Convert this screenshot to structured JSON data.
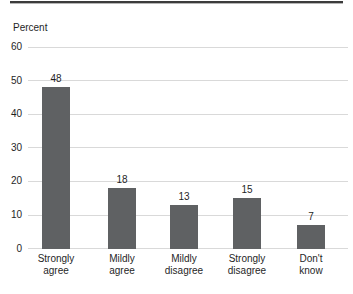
{
  "chart": {
    "colors": {
      "bar": "#5f6163",
      "gridline": "#d9d9d9",
      "text": "#1f1f1f",
      "top_rule": "#3b3b3b"
    }
  },
  "chart_data": {
    "type": "bar",
    "title": "",
    "xlabel": "",
    "ylabel": "Percent",
    "categories": [
      "Strongly agree",
      "Mildly agree",
      "Mildly disagree",
      "Strongly disagree",
      "Don't know"
    ],
    "category_lines": [
      [
        "Strongly",
        "agree"
      ],
      [
        "Mildly",
        "agree"
      ],
      [
        "Mildly",
        "disagree"
      ],
      [
        "Strongly",
        "disagree"
      ],
      [
        "Don't",
        "know"
      ]
    ],
    "values": [
      48,
      18,
      13,
      15,
      7
    ],
    "ylim": [
      0,
      60
    ],
    "ytick_step": 10,
    "ytick_labels": [
      "0",
      "10",
      "20",
      "30",
      "40",
      "50",
      "60"
    ],
    "grid": "horizontal",
    "value_labels_shown": true,
    "legend": "none"
  }
}
